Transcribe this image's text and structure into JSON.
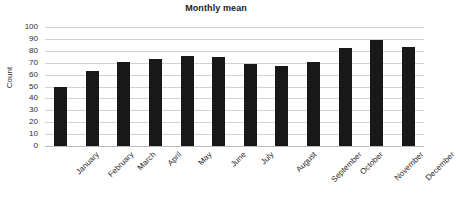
{
  "chart_data": {
    "type": "bar",
    "title": "Monthly mean",
    "xlabel": "",
    "ylabel": "Count",
    "ylim": [
      0,
      100
    ],
    "ytick_step": 10,
    "ytick_labels": [
      "100",
      "90",
      "80",
      "70",
      "60",
      "50",
      "40",
      "30",
      "20",
      "10",
      "0"
    ],
    "grid": true,
    "legend": false,
    "bar_color": "#181818",
    "gridline_color": "#d2d2d2",
    "categories": [
      "January",
      "February",
      "March",
      "April",
      "May",
      "June",
      "July",
      "August",
      "September",
      "October",
      "November",
      "December"
    ],
    "values": [
      50,
      63,
      71,
      73,
      76,
      75,
      69,
      67.5,
      70.5,
      82,
      89,
      83.5
    ]
  }
}
